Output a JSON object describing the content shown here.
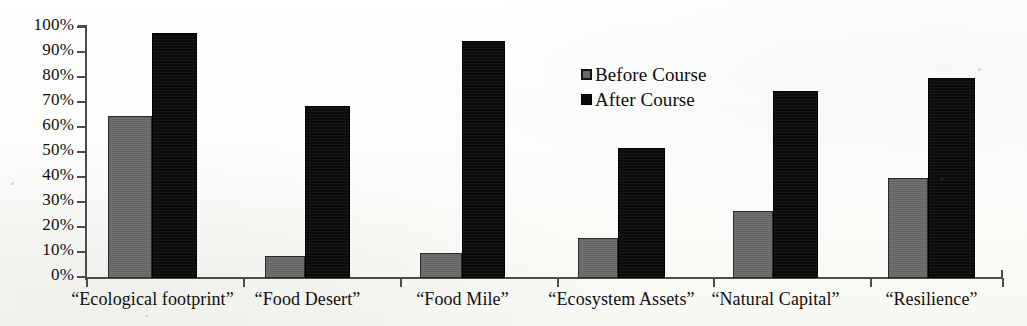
{
  "chart_data": {
    "type": "bar",
    "title": "",
    "subtitle": "",
    "xlabel": "",
    "ylabel": "",
    "ylim": [
      0,
      100
    ],
    "y_unit": "%",
    "grid": false,
    "legend_position": "inside-upper-center",
    "y_ticks": [
      "0%",
      "10%",
      "20%",
      "30%",
      "40%",
      "50%",
      "60%",
      "70%",
      "80%",
      "90%",
      "100%"
    ],
    "y_tick_values": [
      0,
      10,
      20,
      30,
      40,
      50,
      60,
      70,
      80,
      90,
      100
    ],
    "categories": [
      "“Ecological footprint”",
      "“Food Desert”",
      "“Food Mile”",
      "“Ecosystem Assets”",
      "“Natural Capital”",
      "“Resilience”"
    ],
    "series": [
      {
        "name": "Before Course",
        "color": "#6a6a6a",
        "values": [
          65,
          9,
          10,
          16,
          27,
          40
        ]
      },
      {
        "name": "After Course",
        "color": "#0c0c0c",
        "values": [
          98,
          69,
          95,
          52,
          75,
          80
        ]
      }
    ]
  },
  "legend": {
    "items": [
      {
        "label": "Before Course",
        "swatch": "before"
      },
      {
        "label": "After Course",
        "swatch": "after"
      }
    ]
  },
  "axis": {
    "line_color": "#4c4c4c"
  }
}
